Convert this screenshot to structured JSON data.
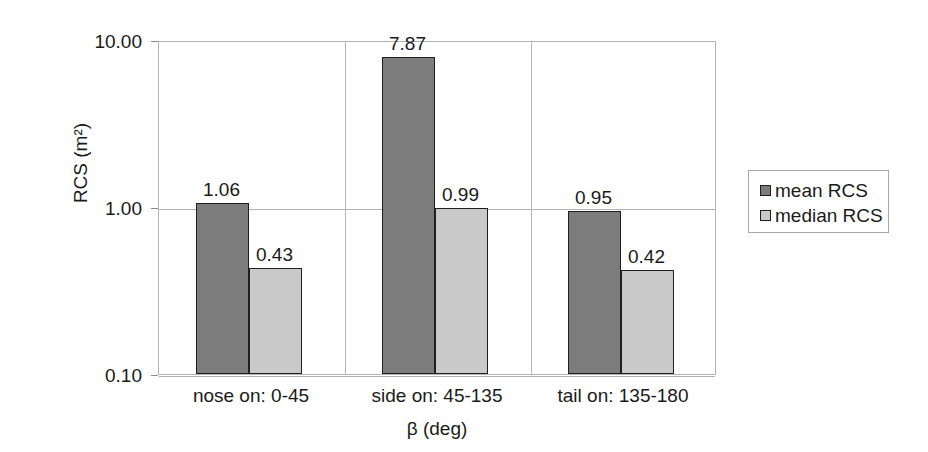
{
  "chart_data": {
    "type": "bar",
    "title": "",
    "xlabel": "β (deg)",
    "ylabel": "RCS (m²)",
    "yscale": "log",
    "ylim": [
      0.1,
      10.0
    ],
    "ytick_labels": [
      "10.00",
      "1.00",
      "0.10"
    ],
    "ytick_values": [
      10.0,
      1.0,
      0.1
    ],
    "grid": "horizontal-and-category-dividers",
    "legend_position": "right",
    "categories": [
      "nose on:  0-45",
      "side on: 45-135",
      "tail on: 135-180"
    ],
    "series": [
      {
        "name": "mean RCS",
        "color": "#7c7c7c",
        "values": [
          1.06,
          7.87,
          0.95
        ],
        "labels": [
          "1.06",
          "7.87",
          "0.95"
        ]
      },
      {
        "name": "median RCS",
        "color": "#c9c9c9",
        "values": [
          0.43,
          0.99,
          0.42
        ],
        "labels": [
          "0.43",
          "0.99",
          "0.42"
        ]
      }
    ]
  },
  "legend": {
    "entries": [
      {
        "label": "mean RCS"
      },
      {
        "label": "median RCS"
      }
    ]
  },
  "colors": {
    "mean": "#7c7c7c",
    "median": "#c9c9c9",
    "bar_outline": "#1f1f1f",
    "gridline": "#b0b0b0",
    "plot_border": "#b4b4b4",
    "text": "#1a1a1a",
    "background": "#ffffff"
  }
}
